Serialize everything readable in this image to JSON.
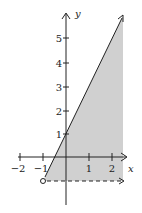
{
  "figure": {
    "type": "region-graph",
    "x_axis": {
      "label": "x",
      "ticks": [
        "−2",
        "−1",
        "1",
        "2"
      ]
    },
    "y_axis": {
      "label": "y",
      "ticks": [
        "1",
        "2",
        "3",
        "4",
        "5"
      ]
    },
    "boundary_line": {
      "equation": "y = 2x + 1",
      "style": "solid"
    },
    "boundary_ray": {
      "equation": "y = -1",
      "style": "dashed"
    },
    "open_point": {
      "x": -1,
      "y": -1
    },
    "shade_color": "#d0d0d0"
  }
}
